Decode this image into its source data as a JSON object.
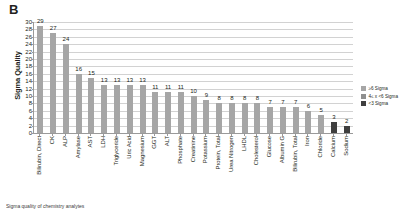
{
  "panel": {
    "letter": "B"
  },
  "caption": {
    "text": "Sigma quality of chemistry analytes"
  },
  "chart_data": {
    "type": "bar",
    "title": "",
    "xlabel": "",
    "ylabel": "Sigma Quality",
    "ylim": [
      0,
      30
    ],
    "ytick_step": 2,
    "yticks": [
      0,
      2,
      4,
      6,
      8,
      10,
      12,
      14,
      16,
      18,
      20,
      22,
      24,
      26,
      28,
      30
    ],
    "grid": true,
    "legend_position": "right",
    "categories": [
      "Bilirubin, Direct",
      "CK",
      "ALP",
      "Amylase",
      "AST",
      "LDH",
      "Triglyceride",
      "Uric Acid",
      "Magnesium",
      "GGT",
      "ALT",
      "Phosphate",
      "Creatinine",
      "Potassium",
      "Protein, Total",
      "Urea Nitrogen",
      "LHDL",
      "Cholesterol",
      "Glucose",
      "Albumin G",
      "Bilirubin, Total",
      "Iron",
      "Chloride",
      "Calcium",
      "Sodium"
    ],
    "values": [
      29,
      27,
      24,
      16,
      15,
      13,
      13,
      13,
      13,
      11,
      11,
      11,
      10,
      9,
      8,
      8,
      8,
      8,
      7,
      7,
      7,
      6,
      5,
      3,
      2
    ],
    "bands": [
      "high",
      "high",
      "high",
      "high",
      "high",
      "high",
      "high",
      "high",
      "high",
      "high",
      "high",
      "high",
      "high",
      "high",
      "high",
      "high",
      "high",
      "high",
      "high",
      "high",
      "high",
      "high",
      "high",
      "low",
      "low"
    ],
    "legend": [
      {
        "label": "≥6 Sigma",
        "color": "#a6a6a6"
      },
      {
        "label": "4≤ x <6 Sigma",
        "color": "#8f8f8f"
      },
      {
        "label": "<3 Sigma",
        "color": "#3f3f3f"
      }
    ]
  }
}
